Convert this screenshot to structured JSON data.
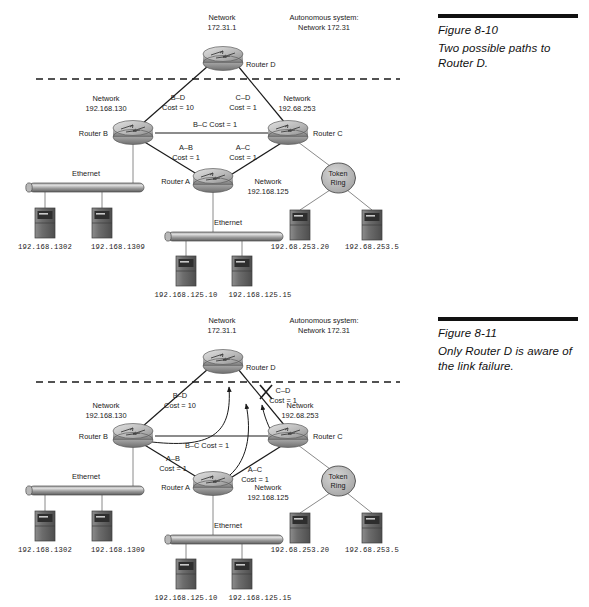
{
  "page": {
    "background": "#ffffff",
    "ink": "#1a1a1a"
  },
  "figures": [
    {
      "id": "figure-8-10",
      "caption": {
        "number": "Figure 8-10",
        "text": "Two possible paths to Router D."
      },
      "labels": {
        "network_d": "Network\n172.31.1",
        "autonomous_system": "Autonomous system:\nNetwork 172.31",
        "router_d": "Router D",
        "router_a": "Router A",
        "router_b": "Router B",
        "router_c": "Router C",
        "network_b": "Network\n192.168.130",
        "network_c": "Network\n192.68.253",
        "network_a": "Network\n192.168.125",
        "link_bd": "B–D\nCost = 10",
        "link_cd": "C–D\nCost = 1",
        "link_bc": "B–C Cost = 1",
        "link_ab": "A–B\nCost = 1",
        "link_ac": "A–C\nCost = 1",
        "ethernet_top": "Ethernet",
        "ethernet_bottom": "Ethernet",
        "token_ring": "Token\nRing",
        "host_b1": "192.168.1302",
        "host_b2": "192.168.1309",
        "host_a1": "192.168.125.10",
        "host_a2": "192.168.125.15",
        "host_c1": "192.68.253.20",
        "host_c2": "192.68.253.5"
      }
    },
    {
      "id": "figure-8-11",
      "caption": {
        "number": "Figure 8-11",
        "text": "Only Router D is aware of the link failure."
      },
      "labels": {
        "network_d": "Network\n172.31.1",
        "autonomous_system": "Autonomous system:\nNetwork 172.31",
        "router_d": "Router D",
        "router_a": "Router A",
        "router_b": "Router B",
        "router_c": "Router C",
        "network_b": "Network\n192.168.130",
        "network_c": "Network\n192.68.253",
        "network_a": "Network\n192.168.125",
        "link_bd": "B–D\nCost = 10",
        "link_cd": "C–D\nCost = 1",
        "link_bc": "B–C Cost = 1",
        "link_ab": "A–B\nCost = 1",
        "link_ac": "A–C\nCost = 1",
        "ethernet_top": "Ethernet",
        "ethernet_bottom": "Ethernet",
        "token_ring": "Token\nRing",
        "host_b1": "192.168.1302",
        "host_b2": "192.168.1309",
        "host_a1": "192.168.125.10",
        "host_a2": "192.168.125.15",
        "host_c1": "192.68.253.20",
        "host_c2": "192.68.253.5",
        "failure_marker": "X"
      }
    }
  ]
}
